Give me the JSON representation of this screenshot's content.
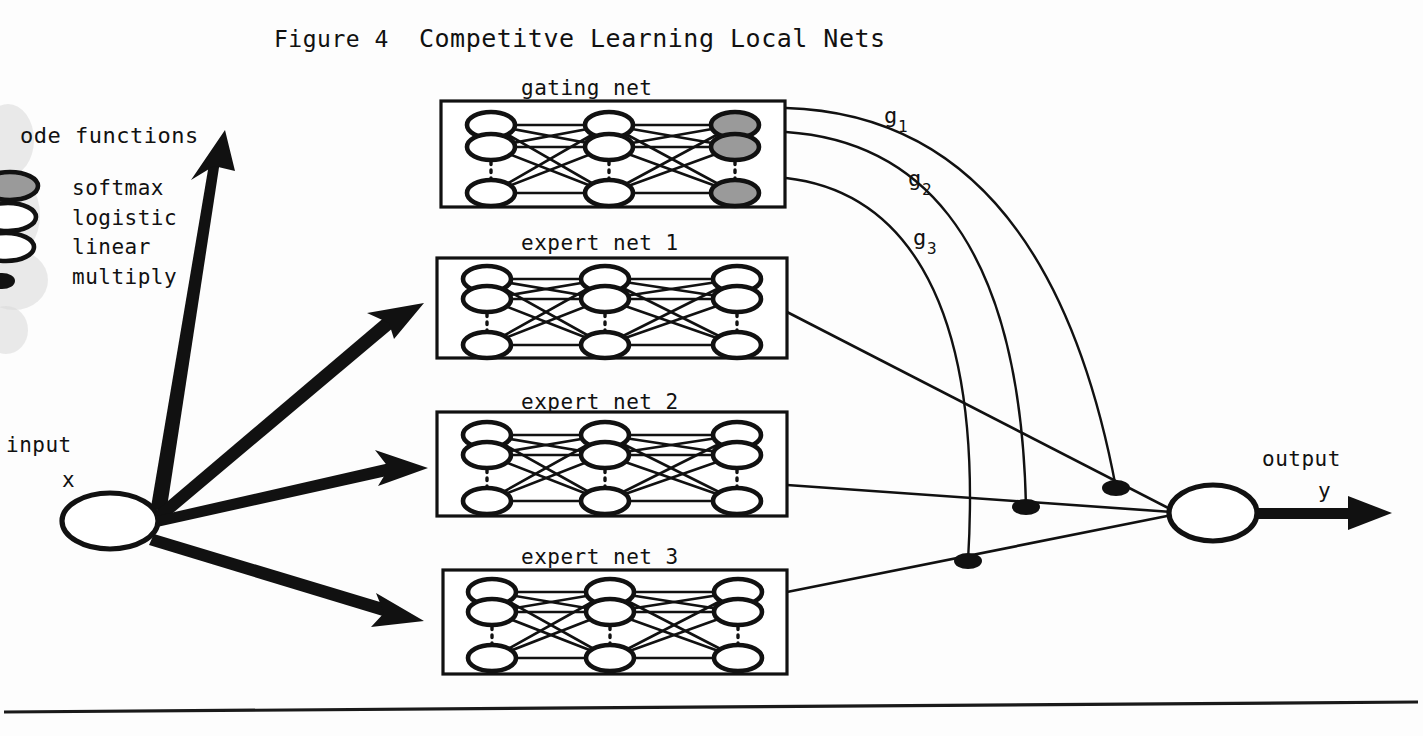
{
  "figure": {
    "number_label": "Figure 4",
    "title": "Competitve Learning Local Nets"
  },
  "legend": {
    "heading": "ode functions",
    "items": [
      {
        "label": "softmax",
        "symbol": "shaded-ellipse-icon"
      },
      {
        "label": "logistic",
        "symbol": "white-ellipse-icon"
      },
      {
        "label": "linear",
        "symbol": "white-ellipse-icon"
      },
      {
        "label": "multiply",
        "symbol": "filled-dot-icon"
      }
    ]
  },
  "input": {
    "label_line1": "input",
    "label_line2": "x"
  },
  "output": {
    "label_line1": "output",
    "label_line2": "y"
  },
  "networks": [
    {
      "id": "gating",
      "label": "gating net",
      "output_node_style": "shaded"
    },
    {
      "id": "expert1",
      "label": "expert net 1",
      "output_node_style": "white"
    },
    {
      "id": "expert2",
      "label": "expert net 2",
      "output_node_style": "white"
    },
    {
      "id": "expert3",
      "label": "expert net 3",
      "output_node_style": "white"
    }
  ],
  "gating_signals": [
    {
      "name": "g",
      "subscript": "1"
    },
    {
      "name": "g",
      "subscript": "2"
    },
    {
      "name": "g",
      "subscript": "3"
    }
  ],
  "multiply_nodes": [
    {
      "id": "mult-g1"
    },
    {
      "id": "mult-g2"
    },
    {
      "id": "mult-g3"
    }
  ],
  "colors": {
    "ink": "#111111",
    "paper": "#ffffff",
    "shaded_node": "#9a9a9a"
  }
}
